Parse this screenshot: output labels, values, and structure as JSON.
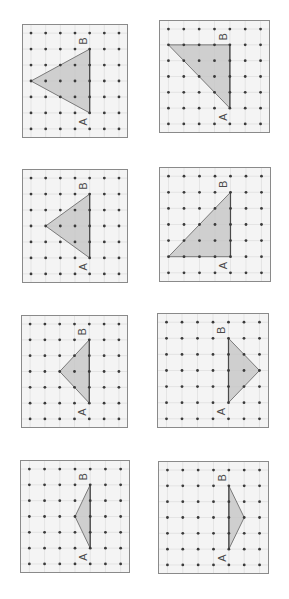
{
  "worksheet": {
    "colors": {
      "background": "#ffffff",
      "frame_fill": "#f4f4f4",
      "frame_stroke": "#8a8a8a",
      "grid_line": "#dcdcdc",
      "dot": "#3a3a3a",
      "triangle_fill": "#c8c8c8",
      "triangle_stroke": "#6e6e6e",
      "base_stroke": "#4a4a4a",
      "label": "#4a4a4a"
    },
    "grid": {
      "cols": 7,
      "rows": 7
    },
    "label_a": "A",
    "label_b": "B",
    "panels": [
      {
        "id": 1,
        "x": 22,
        "y": 24,
        "w": 106,
        "h": 114,
        "a": [
          4,
          5
        ],
        "b": [
          4,
          1
        ],
        "apex": [
          0,
          3
        ]
      },
      {
        "id": 2,
        "x": 159,
        "y": 20,
        "w": 111,
        "h": 113,
        "a": [
          4,
          5
        ],
        "b": [
          4,
          1
        ],
        "apex": [
          0,
          1
        ]
      },
      {
        "id": 3,
        "x": 22,
        "y": 169,
        "w": 106,
        "h": 114,
        "a": [
          4,
          5
        ],
        "b": [
          4,
          1
        ],
        "apex": [
          1,
          3
        ]
      },
      {
        "id": 4,
        "x": 159,
        "y": 167,
        "w": 112,
        "h": 115,
        "a": [
          4,
          5
        ],
        "b": [
          4,
          1
        ],
        "apex": [
          0,
          5
        ]
      },
      {
        "id": 5,
        "x": 21,
        "y": 315,
        "w": 107,
        "h": 113,
        "a": [
          4,
          5
        ],
        "b": [
          4,
          1
        ],
        "apex": [
          2,
          3
        ]
      },
      {
        "id": 6,
        "x": 157,
        "y": 313,
        "w": 112,
        "h": 115,
        "a": [
          4,
          5
        ],
        "b": [
          4,
          1
        ],
        "apex": [
          6,
          3
        ]
      },
      {
        "id": 7,
        "x": 20,
        "y": 460,
        "w": 110,
        "h": 113,
        "a": [
          4,
          5
        ],
        "b": [
          4,
          1
        ],
        "apex": [
          3,
          3
        ]
      },
      {
        "id": 8,
        "x": 158,
        "y": 461,
        "w": 111,
        "h": 113,
        "a": [
          4,
          5
        ],
        "b": [
          4,
          1
        ],
        "apex": [
          5,
          3
        ]
      }
    ]
  }
}
